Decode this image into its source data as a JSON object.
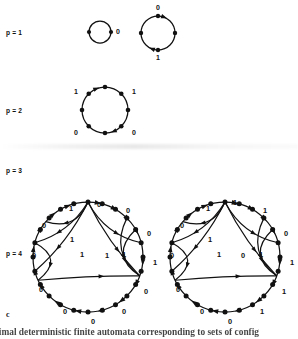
{
  "figure": {
    "panel_letter": "c",
    "caption": "inimal deterministic finite automata corresponding to sets of config",
    "rows": [
      {
        "label": "p = 1"
      },
      {
        "label": "p = 2"
      },
      {
        "label": "p = 3"
      },
      {
        "label": "p = 4"
      }
    ]
  },
  "diagrams": {
    "p1_small": {
      "name": "two-state-cycle",
      "cx": 100,
      "cy": 32,
      "r": 11,
      "nodes": 2,
      "node_angles": [
        180,
        0
      ],
      "edge_labels": [
        {
          "text": "0",
          "x": 118,
          "y": 32
        }
      ],
      "arrowheads": []
    },
    "p1_large": {
      "name": "four-state-cycle",
      "cx": 158,
      "cy": 33,
      "r": 17,
      "nodes": 4,
      "node_angles": [
        270,
        0,
        90,
        180
      ],
      "edge_labels": [
        {
          "text": "0",
          "x": 158,
          "y": 8
        },
        {
          "text": "1",
          "x": 158,
          "y": 58
        }
      ],
      "arrowheads": [
        {
          "angle": 290
        },
        {
          "angle": 110
        }
      ]
    },
    "p2": {
      "name": "eight-state-cycle",
      "cx": 105,
      "cy": 110,
      "r": 23,
      "nodes": 8,
      "node_angles": [
        270,
        315,
        0,
        45,
        90,
        135,
        180,
        225
      ],
      "edge_labels": [
        {
          "text": "1",
          "x": 76,
          "y": 92
        },
        {
          "text": "1",
          "x": 134,
          "y": 92
        },
        {
          "text": "0",
          "x": 76,
          "y": 133
        },
        {
          "text": "0",
          "x": 134,
          "y": 133
        }
      ],
      "arrowheads": [
        {
          "angle": 247
        },
        {
          "angle": 67
        }
      ]
    },
    "p4_left": {
      "name": "p4-automaton-left",
      "cx": 88,
      "cy": 257,
      "r": 55,
      "nodes": 24,
      "edge_labels": [
        {
          "text": "0",
          "x": 99,
          "y": 205
        },
        {
          "text": "1",
          "x": 71,
          "y": 209
        },
        {
          "text": "0",
          "x": 128,
          "y": 211
        },
        {
          "text": "0",
          "x": 44,
          "y": 226
        },
        {
          "text": "0",
          "x": 149,
          "y": 234
        },
        {
          "text": "1",
          "x": 72,
          "y": 240
        },
        {
          "text": "1",
          "x": 82,
          "y": 255
        },
        {
          "text": "1",
          "x": 107,
          "y": 256
        },
        {
          "text": "1",
          "x": 124,
          "y": 255
        },
        {
          "text": "0",
          "x": 34,
          "y": 256
        },
        {
          "text": "1",
          "x": 155,
          "y": 263
        },
        {
          "text": "0",
          "x": 41,
          "y": 290
        },
        {
          "text": "0",
          "x": 146,
          "y": 292
        },
        {
          "text": "0",
          "x": 65,
          "y": 312
        },
        {
          "text": "0",
          "x": 124,
          "y": 312
        },
        {
          "text": "0",
          "x": 93,
          "y": 322
        }
      ]
    },
    "p4_right": {
      "name": "p4-automaton-right",
      "cx": 225,
      "cy": 257,
      "r": 55,
      "nodes": 24,
      "edge_labels": [
        {
          "text": "1",
          "x": 235,
          "y": 203
        },
        {
          "text": "1",
          "x": 208,
          "y": 209
        },
        {
          "text": "1",
          "x": 265,
          "y": 211
        },
        {
          "text": "0",
          "x": 182,
          "y": 226
        },
        {
          "text": "0",
          "x": 286,
          "y": 234
        },
        {
          "text": "1",
          "x": 210,
          "y": 240
        },
        {
          "text": "1",
          "x": 219,
          "y": 255
        },
        {
          "text": "0",
          "x": 243,
          "y": 256
        },
        {
          "text": "1",
          "x": 261,
          "y": 255
        },
        {
          "text": "0",
          "x": 172,
          "y": 256
        },
        {
          "text": "1",
          "x": 292,
          "y": 263
        },
        {
          "text": "0",
          "x": 178,
          "y": 290
        },
        {
          "text": "1",
          "x": 284,
          "y": 292
        },
        {
          "text": "0",
          "x": 202,
          "y": 312
        },
        {
          "text": "1",
          "x": 262,
          "y": 312
        },
        {
          "text": "0",
          "x": 230,
          "y": 322
        }
      ]
    }
  }
}
